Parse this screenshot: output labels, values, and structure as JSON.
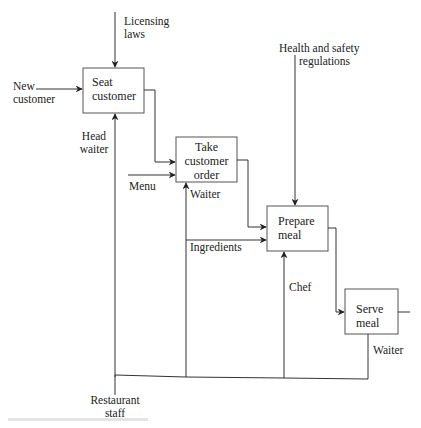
{
  "diagram": {
    "type": "IDEF0 process diagram",
    "activities": [
      {
        "id": "seat",
        "line1": "Seat",
        "line2": "customer",
        "line3": ""
      },
      {
        "id": "take",
        "line1": "Take",
        "line2": "customer",
        "line3": "order"
      },
      {
        "id": "prepare",
        "line1": "Prepare",
        "line2": "meal",
        "line3": ""
      },
      {
        "id": "serve",
        "line1": "Serve",
        "line2": "meal",
        "line3": ""
      }
    ],
    "labels": {
      "licensing_1": "Licensing",
      "licensing_2": "laws",
      "new_customer_1": "New",
      "new_customer_2": "customer",
      "head_waiter_1": "Head",
      "head_waiter_2": "waiter",
      "menu": "Menu",
      "waiter_take": "Waiter",
      "ingredients": "Ingredients",
      "health_1": "Health and safety",
      "health_2": "regulations",
      "chef": "Chef",
      "waiter_serve": "Waiter",
      "restaurant_1": "Restaurant",
      "restaurant_2": "staff"
    },
    "colors": {
      "line": "#333333",
      "box": "#555555",
      "text": "#222222"
    }
  }
}
